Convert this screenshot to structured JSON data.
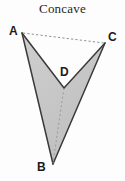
{
  "figure": {
    "title": "Concave",
    "shape_name": "concave-quadrilateral",
    "colors": {
      "background": "#fdfdfd",
      "fill": "#c9c9c9",
      "stroke": "#3a3a3a",
      "dashed_stroke": "#8a8a8a",
      "label": "#1c1c1c",
      "title": "#262626"
    },
    "vertices": [
      {
        "name": "A",
        "label": "A",
        "x": 22,
        "y": 33
      },
      {
        "name": "D",
        "label": "D",
        "x": 64,
        "y": 88
      },
      {
        "name": "C",
        "label": "C",
        "x": 105,
        "y": 43
      },
      {
        "name": "B",
        "label": "B",
        "x": 53,
        "y": 164
      }
    ],
    "solid_edges": [
      {
        "name": "edge-AD",
        "from": "A",
        "to": "D"
      },
      {
        "name": "edge-DC",
        "from": "D",
        "to": "C"
      },
      {
        "name": "edge-CB",
        "from": "C",
        "to": "B"
      },
      {
        "name": "edge-BA",
        "from": "B",
        "to": "A"
      }
    ],
    "dashed_edges": [
      {
        "name": "diagonal-AC",
        "from": "A",
        "to": "C"
      },
      {
        "name": "diagonal-DB",
        "from": "D",
        "to": "B"
      }
    ],
    "polygon_points": "22,33 64,88 105,43 53,164"
  }
}
